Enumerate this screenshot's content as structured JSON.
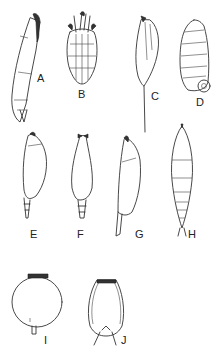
{
  "figure": {
    "panels": [
      {
        "id": "A",
        "label": "A",
        "subject": "elongated organism, lateral view"
      },
      {
        "id": "B",
        "label": "B",
        "subject": "segmented organism, dorsal view with appendages"
      },
      {
        "id": "C",
        "label": "C",
        "subject": "fusiform organism with long tail spine"
      },
      {
        "id": "D",
        "label": "D",
        "subject": "coiled segmented organism"
      },
      {
        "id": "E",
        "label": "E",
        "subject": "elongated organism, lateral view"
      },
      {
        "id": "F",
        "label": "F",
        "subject": "elongated organism, dorsal view"
      },
      {
        "id": "G",
        "label": "G",
        "subject": "elongated organism, lateral view"
      },
      {
        "id": "H",
        "label": "H",
        "subject": "segmented spindle-shaped organism"
      },
      {
        "id": "I",
        "label": "I",
        "subject": "spherical organism with short stalk"
      },
      {
        "id": "J",
        "label": "J",
        "subject": "urn-shaped organism with spines"
      }
    ]
  }
}
